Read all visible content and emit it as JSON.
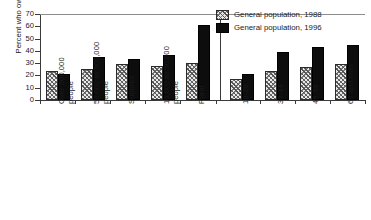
{
  "chart_data": {
    "type": "bar",
    "title": "",
    "xlabel": "",
    "ylabel": "Percent who own guns",
    "ylim": [
      0,
      70
    ],
    "ytick_step": 10,
    "yticks": [
      "0",
      "10",
      "20",
      "30",
      "40",
      "50",
      "60",
      "70"
    ],
    "grid": false,
    "legend_position": "top-right",
    "group_divider_after_category": "Rural",
    "categories": [
      "Over 500,000\npeople",
      "50,000 to 500,000\npeople",
      "Suburbs",
      "10,000 to 50,000\npeople",
      "Rural",
      "18-29",
      "30-44",
      "45-59",
      "60 and over"
    ],
    "series": [
      {
        "name": "General population, 1988",
        "style": "hatched",
        "values": [
          24,
          25,
          29,
          28,
          30,
          17,
          24,
          27,
          29
        ]
      },
      {
        "name": "General population, 1996",
        "style": "solid-black",
        "values": [
          21.5,
          35,
          33.5,
          36.5,
          61,
          21,
          39,
          43,
          45
        ]
      }
    ]
  },
  "legend": {
    "entries": [
      "General population, 1988",
      "General population, 1996"
    ]
  }
}
